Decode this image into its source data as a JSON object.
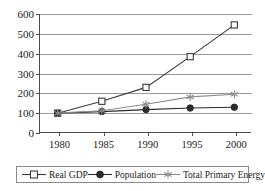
{
  "chart_data": {
    "type": "line",
    "title": "",
    "subtitle": "",
    "xlabel": "",
    "ylabel": "",
    "categories": [
      "1980",
      "1985",
      "1990",
      "1995",
      "2000"
    ],
    "x": [
      1980,
      1985,
      1990,
      1995,
      2000
    ],
    "xlim": [
      1978,
      2002
    ],
    "ylim": [
      0,
      600
    ],
    "ytick_labels": [
      "0",
      "100",
      "200",
      "300",
      "400",
      "500",
      "600"
    ],
    "yticks": [
      0,
      100,
      200,
      300,
      400,
      500,
      600
    ],
    "grid": "horizontal",
    "legend_position": "bottom",
    "series": [
      {
        "name": "Real GDP",
        "marker": "open-square",
        "color": "#3a3a3a",
        "values": [
          100,
          160,
          230,
          385,
          545
        ]
      },
      {
        "name": "Population",
        "marker": "filled-circle",
        "color": "#2b2b2b",
        "values": [
          100,
          108,
          118,
          126,
          130
        ]
      },
      {
        "name": "Total Primary Energy",
        "marker": "asterisk",
        "color": "#8c8c8c",
        "values": [
          100,
          112,
          145,
          182,
          195
        ]
      }
    ]
  },
  "axes": {
    "y_ticks": [
      "600",
      "500",
      "400",
      "300",
      "200",
      "100",
      "0"
    ],
    "x_ticks": [
      "1980",
      "1985",
      "1990",
      "1995",
      "2000"
    ]
  },
  "legend": {
    "items": [
      {
        "label": "Real GDP",
        "marker": "open-square-marker"
      },
      {
        "label": "Population",
        "marker": "filled-circle-marker"
      },
      {
        "label": "Total Primary Energy",
        "marker": "asterisk-marker"
      }
    ]
  },
  "colors": {
    "axis": "#4c4c4c",
    "grid": "#9a9a9a",
    "series_gdp": "#3a3a3a",
    "series_population": "#2b2b2b",
    "series_energy": "#8c8c8c",
    "text": "#1a1a1a",
    "background": "#ffffff"
  }
}
